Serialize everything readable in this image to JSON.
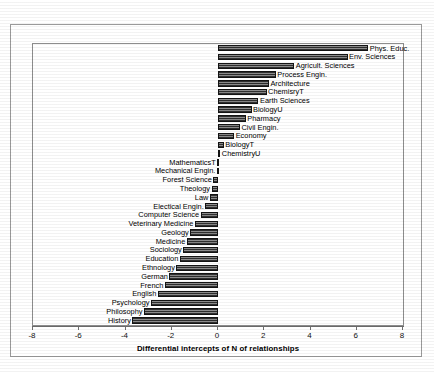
{
  "chart_data": {
    "type": "bar",
    "orientation": "horizontal",
    "title": "",
    "xlabel": "Differential intercepts of N of relationships",
    "ylabel": "",
    "xlim": [
      -8,
      8
    ],
    "xticks": [
      -8,
      -6,
      -4,
      -2,
      0,
      2,
      4,
      6,
      8
    ],
    "xtick_labels": [
      "-8",
      "-6",
      "-4",
      "-2",
      "0",
      "2",
      "4",
      "6",
      "8"
    ],
    "grid": false,
    "legend": "none",
    "categories": [
      "Phys. Educ.",
      "Env. Sciences",
      "Agricult. Sciences",
      "Process Engin.",
      "Architecture",
      "ChemisryT",
      "Earth Sciences",
      "BiologyU",
      "Pharmacy",
      "Civil Engin.",
      "Economy",
      "BiologyT",
      "ChemistryU",
      "MathematicsT",
      "Mechanical Engin.",
      "Forest Science",
      "Theology",
      "Law",
      "Electical Engin.",
      "Computer Science",
      "Veterinary Medicine",
      "Geology",
      "Medicine",
      "Sociology",
      "Education",
      "Ethnology",
      "German",
      "French",
      "English",
      "Psychology",
      "Philosophy",
      "History"
    ],
    "values": [
      6.5,
      5.6,
      3.3,
      2.5,
      2.2,
      2.1,
      1.75,
      1.45,
      1.2,
      0.95,
      0.7,
      0.25,
      0.1,
      -0.02,
      -0.05,
      -0.2,
      -0.28,
      -0.35,
      -0.55,
      -0.75,
      -1.0,
      -1.2,
      -1.35,
      -1.5,
      -1.65,
      -1.8,
      -2.1,
      -2.3,
      -2.6,
      -2.9,
      -3.2,
      -3.7
    ],
    "bar_color": "#3a3a3a",
    "bar_edge_color": "#141414"
  }
}
